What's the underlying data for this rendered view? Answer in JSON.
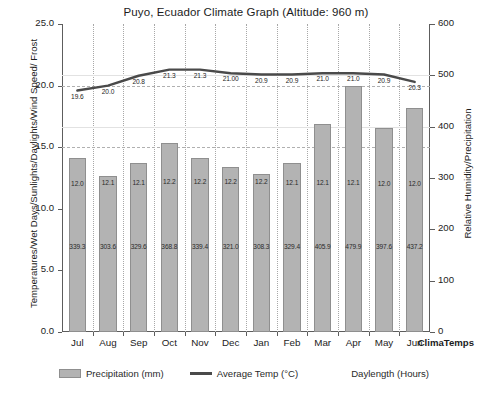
{
  "brand": "ClimaTemps",
  "legend": [
    {
      "name": "precipitation",
      "label": "Precipitation (mm)",
      "swatch": "bar"
    },
    {
      "name": "average-temp",
      "label": "Average Temp (°C)",
      "swatch": "line"
    },
    {
      "name": "daylength",
      "label": "Daylength (Hours)",
      "swatch": "blank"
    }
  ],
  "chart_data": {
    "type": "bar",
    "title": "Puyo, Ecuador Climate Graph (Altitude: 960 m)",
    "categories": [
      "Jul",
      "Aug",
      "Sep",
      "Oct",
      "Nov",
      "Dec",
      "Jan",
      "Feb",
      "Mar",
      "Apr",
      "May",
      "Jun"
    ],
    "xlabel": "",
    "ylabel": "Temperatures/Wet Days/Sunlights/Daylights/Wind Speed/ Frost",
    "ylabel_right": "Relative Humidity/Precipitation",
    "ylim": [
      0,
      25
    ],
    "ylim_right": [
      0,
      600
    ],
    "yticks": [
      "0.0",
      "5.0",
      "10.0",
      "15.0",
      "20.0",
      "25.0"
    ],
    "yticks_right": [
      "0",
      "100",
      "200",
      "300",
      "400",
      "500",
      "600"
    ],
    "grid": true,
    "legend_position": "bottom",
    "series": [
      {
        "name": "Precipitation (mm)",
        "type": "bar",
        "axis": "right",
        "values": [
          339.3,
          303.6,
          329.6,
          368.8,
          339.4,
          321.0,
          308.3,
          329.4,
          405.9,
          479.9,
          397.6,
          437.2
        ],
        "labels": [
          "339.3",
          "303.6",
          "329.6",
          "368.8",
          "339.4",
          "321.0",
          "308.3",
          "329.4",
          "405.9",
          "479.9",
          "397.6",
          "437.2"
        ]
      },
      {
        "name": "Average Temp (°C)",
        "type": "line",
        "axis": "left",
        "values": [
          19.6,
          20.0,
          20.8,
          21.3,
          21.3,
          21.0,
          20.9,
          20.9,
          21.0,
          21.0,
          20.9,
          20.3
        ],
        "labels": [
          "19.6",
          "20.0",
          "20.8",
          "21.3",
          "21.3",
          "21.00",
          "20.9",
          "20.9",
          "21.0",
          "21.0",
          "20.9",
          "20.3"
        ]
      },
      {
        "name": "Daylength (Hours)",
        "type": "bar-label",
        "axis": "left",
        "values": [
          12.0,
          12.1,
          12.1,
          12.2,
          12.2,
          12.2,
          12.2,
          12.1,
          12.1,
          12.1,
          12.0,
          12.0
        ],
        "labels": [
          "12.0",
          "12.1",
          "12.1",
          "12.2",
          "12.2",
          "12.2",
          "12.2",
          "12.1",
          "12.1",
          "12.1",
          "12.0",
          "12.0"
        ]
      }
    ]
  }
}
